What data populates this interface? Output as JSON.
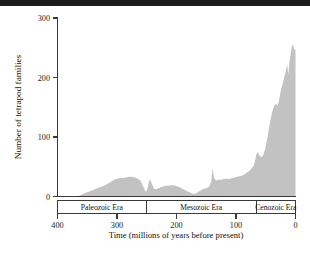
{
  "figure": {
    "background_color": "#ffffff",
    "top_bar_color": "#1d1d1f"
  },
  "chart_data": {
    "type": "area",
    "title": "",
    "subtitle": "",
    "xlabel": "Time (millions of years before present)",
    "ylabel": "Number of tetrapod families",
    "xlim": [
      400,
      0
    ],
    "ylim": [
      0,
      300
    ],
    "x_reversed": true,
    "grid": false,
    "legend": "none",
    "fill_color": "#c2c2c2",
    "xticks": [
      400,
      300,
      200,
      100,
      0
    ],
    "xtick_labels": [
      "400",
      "300",
      "200",
      "100",
      "0"
    ],
    "yticks": [
      0,
      100,
      200,
      300
    ],
    "ytick_labels": [
      "0",
      "100",
      "200",
      "300"
    ],
    "series_name": "Tetrapod families",
    "x": [
      400,
      390,
      380,
      372,
      365,
      360,
      355,
      350,
      345,
      340,
      335,
      330,
      325,
      320,
      315,
      310,
      305,
      300,
      295,
      290,
      285,
      280,
      275,
      270,
      265,
      260,
      258,
      255,
      253,
      251,
      249,
      247,
      245,
      242,
      238,
      234,
      230,
      226,
      222,
      218,
      214,
      210,
      206,
      202,
      198,
      194,
      190,
      186,
      182,
      178,
      174,
      170,
      166,
      162,
      158,
      154,
      150,
      146,
      144,
      142,
      141,
      140,
      139,
      138,
      136,
      133,
      130,
      126,
      122,
      118,
      114,
      110,
      106,
      102,
      98,
      94,
      90,
      86,
      82,
      78,
      74,
      70,
      68,
      66,
      64,
      62,
      60,
      57,
      54,
      51,
      48,
      45,
      42,
      39,
      36,
      33,
      30,
      28,
      26,
      24,
      22,
      20,
      18,
      16,
      14,
      12,
      10,
      8,
      6,
      4,
      2,
      0
    ],
    "y": [
      0,
      0,
      0,
      0,
      1,
      3,
      5,
      7,
      9,
      11,
      13,
      15,
      17,
      19,
      22,
      25,
      28,
      30,
      31,
      31,
      32,
      33,
      33,
      32,
      30,
      26,
      21,
      15,
      10,
      8,
      12,
      22,
      29,
      23,
      13,
      12,
      14,
      16,
      17,
      18,
      18,
      19,
      19,
      18,
      17,
      15,
      13,
      11,
      9,
      7,
      5,
      4,
      6,
      9,
      11,
      13,
      14,
      16,
      19,
      24,
      31,
      41,
      48,
      38,
      30,
      27,
      28,
      28,
      29,
      30,
      30,
      30,
      31,
      32,
      33,
      34,
      35,
      37,
      40,
      43,
      47,
      52,
      60,
      70,
      74,
      72,
      68,
      66,
      70,
      80,
      95,
      112,
      128,
      143,
      152,
      156,
      152,
      160,
      172,
      181,
      188,
      196,
      204,
      212,
      222,
      206,
      228,
      240,
      252,
      256,
      246,
      248
    ],
    "era_bands": [
      {
        "label": "Paleozoic Era",
        "start": 400,
        "end": 251
      },
      {
        "label": "Mesozoic Era",
        "start": 251,
        "end": 66
      },
      {
        "label": "Cenozoic Era",
        "start": 66,
        "end": 0
      }
    ],
    "annotations": []
  },
  "caption": {
    "text": ""
  }
}
